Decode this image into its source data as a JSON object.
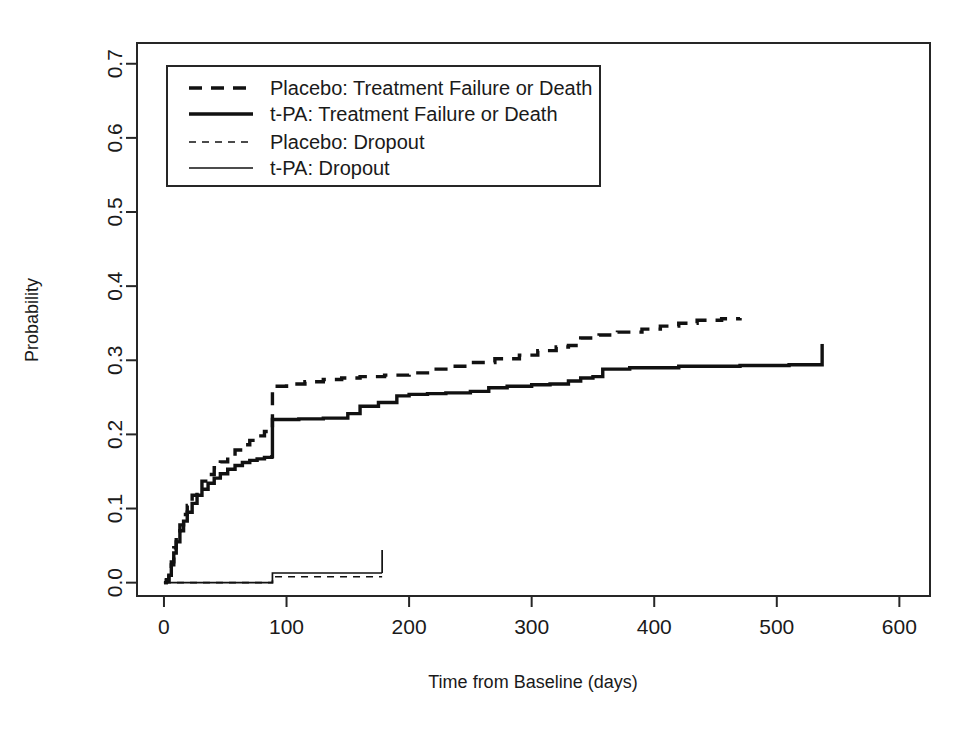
{
  "figure": {
    "background": "#ffffff",
    "ink_color": "#111111",
    "plot_box": {
      "left": 137,
      "top": 43,
      "right": 930,
      "bottom": 596
    }
  },
  "chart_data": {
    "type": "line",
    "title": "",
    "xlabel": "Time from Baseline (days)",
    "ylabel": "Probability",
    "xlim": [
      -22,
      625
    ],
    "ylim": [
      -0.018,
      0.728
    ],
    "xticks": [
      0,
      100,
      200,
      300,
      400,
      500,
      600
    ],
    "xticklabels": [
      "0",
      "100",
      "200",
      "300",
      "400",
      "500",
      "600"
    ],
    "yticks": [
      0.0,
      0.1,
      0.2,
      0.3,
      0.4,
      0.5,
      0.6,
      0.7
    ],
    "yticklabels": [
      "0.0",
      "0.1",
      "0.2",
      "0.3",
      "0.4",
      "0.5",
      "0.6",
      "0.7"
    ],
    "grid": false,
    "legend_position": "upper left",
    "series": [
      {
        "name": "Placebo: Treatment Failure or Death",
        "style": "dashed",
        "width": "thick",
        "step": "post",
        "points": [
          [
            0,
            0.0
          ],
          [
            2,
            0.004
          ],
          [
            4,
            0.012
          ],
          [
            6,
            0.028
          ],
          [
            8,
            0.047
          ],
          [
            10,
            0.062
          ],
          [
            13,
            0.078
          ],
          [
            16,
            0.092
          ],
          [
            19,
            0.104
          ],
          [
            23,
            0.118
          ],
          [
            27,
            0.128
          ],
          [
            31,
            0.137
          ],
          [
            36,
            0.146
          ],
          [
            41,
            0.155
          ],
          [
            46,
            0.163
          ],
          [
            52,
            0.171
          ],
          [
            58,
            0.179
          ],
          [
            64,
            0.186
          ],
          [
            70,
            0.192
          ],
          [
            76,
            0.198
          ],
          [
            82,
            0.204
          ],
          [
            88,
            0.209
          ],
          [
            88.5,
            0.265
          ],
          [
            100,
            0.268
          ],
          [
            115,
            0.271
          ],
          [
            130,
            0.274
          ],
          [
            145,
            0.276
          ],
          [
            160,
            0.278
          ],
          [
            180,
            0.28
          ],
          [
            200,
            0.283
          ],
          [
            215,
            0.288
          ],
          [
            230,
            0.292
          ],
          [
            250,
            0.297
          ],
          [
            270,
            0.302
          ],
          [
            290,
            0.307
          ],
          [
            305,
            0.313
          ],
          [
            320,
            0.318
          ],
          [
            330,
            0.32
          ],
          [
            340,
            0.33
          ],
          [
            355,
            0.334
          ],
          [
            370,
            0.338
          ],
          [
            390,
            0.342
          ],
          [
            405,
            0.346
          ],
          [
            420,
            0.35
          ],
          [
            435,
            0.354
          ],
          [
            455,
            0.356
          ],
          [
            470,
            0.357
          ]
        ],
        "end_mark": null
      },
      {
        "name": "t-PA: Treatment Failure or Death",
        "style": "solid",
        "width": "thick",
        "step": "post",
        "points": [
          [
            0,
            0.0
          ],
          [
            2,
            0.003
          ],
          [
            4,
            0.01
          ],
          [
            6,
            0.024
          ],
          [
            8,
            0.04
          ],
          [
            10,
            0.055
          ],
          [
            13,
            0.07
          ],
          [
            16,
            0.083
          ],
          [
            19,
            0.095
          ],
          [
            23,
            0.107
          ],
          [
            27,
            0.118
          ],
          [
            31,
            0.126
          ],
          [
            36,
            0.134
          ],
          [
            41,
            0.141
          ],
          [
            46,
            0.147
          ],
          [
            52,
            0.153
          ],
          [
            58,
            0.158
          ],
          [
            64,
            0.162
          ],
          [
            70,
            0.165
          ],
          [
            76,
            0.167
          ],
          [
            82,
            0.169
          ],
          [
            88,
            0.17
          ],
          [
            88.5,
            0.22
          ],
          [
            110,
            0.221
          ],
          [
            130,
            0.222
          ],
          [
            150,
            0.228
          ],
          [
            160,
            0.238
          ],
          [
            175,
            0.243
          ],
          [
            190,
            0.252
          ],
          [
            200,
            0.254
          ],
          [
            215,
            0.255
          ],
          [
            230,
            0.256
          ],
          [
            250,
            0.258
          ],
          [
            265,
            0.263
          ],
          [
            280,
            0.265
          ],
          [
            300,
            0.267
          ],
          [
            315,
            0.268
          ],
          [
            330,
            0.272
          ],
          [
            340,
            0.276
          ],
          [
            350,
            0.278
          ],
          [
            358,
            0.288
          ],
          [
            380,
            0.29
          ],
          [
            420,
            0.292
          ],
          [
            470,
            0.293
          ],
          [
            510,
            0.294
          ],
          [
            537,
            0.295
          ]
        ],
        "end_mark": {
          "x": 537,
          "y_from": 0.295,
          "y_to": 0.322
        }
      },
      {
        "name": "Placebo: Dropout",
        "style": "dashed",
        "width": "thin",
        "step": "post",
        "points": [
          [
            0,
            0.0
          ],
          [
            88,
            0.0
          ],
          [
            88.5,
            0.008
          ],
          [
            120,
            0.008
          ],
          [
            150,
            0.008
          ],
          [
            178,
            0.008
          ]
        ],
        "end_mark": null
      },
      {
        "name": "t-PA: Dropout",
        "style": "solid",
        "width": "thin",
        "step": "post",
        "points": [
          [
            0,
            0.0
          ],
          [
            88,
            0.0
          ],
          [
            88.5,
            0.013
          ],
          [
            120,
            0.013
          ],
          [
            150,
            0.013
          ],
          [
            178,
            0.013
          ]
        ],
        "end_mark": {
          "x": 178,
          "y_from": 0.013,
          "y_to": 0.044
        }
      }
    ],
    "legend_entries": [
      {
        "label": "Placebo: Treatment Failure or Death",
        "style": "dashed",
        "width": "thick"
      },
      {
        "label": "t-PA: Treatment Failure or Death",
        "style": "solid",
        "width": "thick"
      },
      {
        "label": "Placebo: Dropout",
        "style": "dashed",
        "width": "thin"
      },
      {
        "label": "t-PA: Dropout",
        "style": "solid",
        "width": "thin"
      }
    ]
  }
}
